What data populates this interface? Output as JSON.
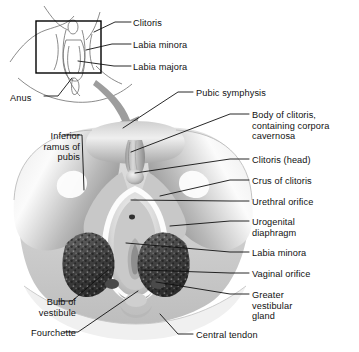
{
  "figure": {
    "background_color": "#ffffff",
    "ink_color": "#111111",
    "arrow_color": "#9a9a9a"
  },
  "inset": {
    "name": "orientation-inset",
    "box_color": "#000000",
    "labels": [
      {
        "id": "clitoris",
        "text": "Clitoris",
        "x": 133,
        "y": 18,
        "leader": "M131,22 L115,22 L94,32"
      },
      {
        "id": "labia-minora",
        "text": "Labia minora",
        "x": 133,
        "y": 40,
        "leader": "M131,44 L112,44 L86,50"
      },
      {
        "id": "labia-majora",
        "text": "Labia majora",
        "x": 133,
        "y": 62,
        "leader": "M131,66 L114,66 L78,61"
      },
      {
        "id": "anus",
        "text": "Anus",
        "x": 10,
        "y": 93,
        "leader": "M44,96 L58,96 L72,78"
      }
    ]
  },
  "main": {
    "name": "main-dissection-figure",
    "labels_right": [
      {
        "id": "pubic-symphysis",
        "text": "Pubic symphysis",
        "x": 196,
        "y": 88,
        "leader": "M193,92 L178,92 L123,128"
      },
      {
        "id": "body-of-clitoris",
        "text": "Body of clitoris,\ncontaining corpora\ncavernosa",
        "x": 252,
        "y": 110,
        "leader": "M249,114 L230,114 L131,152"
      },
      {
        "id": "clitoris-head",
        "text": "Clitoris (head)",
        "x": 252,
        "y": 155,
        "leader": "M249,159 L230,159 L135,173"
      },
      {
        "id": "crus-of-clitoris",
        "text": "Crus of clitoris",
        "x": 252,
        "y": 176,
        "leader": "M249,180 L230,180 L160,196"
      },
      {
        "id": "urethral-orifice",
        "text": "Urethral orifice",
        "x": 252,
        "y": 197,
        "leader": "M249,201 L230,201 L131,200"
      },
      {
        "id": "urogenital-diaphragm",
        "text": "Urogenital\ndiaphragm",
        "x": 252,
        "y": 217,
        "leader": "M249,221 L230,221 L170,226"
      },
      {
        "id": "labia-minora-main",
        "text": "Labia minora",
        "x": 252,
        "y": 248,
        "leader": "M249,252 L230,252 L126,243"
      },
      {
        "id": "vaginal-orifice",
        "text": "Vaginal orifice",
        "x": 252,
        "y": 269,
        "leader": "M249,273 L230,273 L141,270"
      },
      {
        "id": "greater-vestibular-gland",
        "text": "Greater\nvestibular\ngland",
        "x": 252,
        "y": 290,
        "leader": "M249,294 L230,294 L156,282"
      },
      {
        "id": "central-tendon",
        "text": "Central tendon",
        "x": 196,
        "y": 330,
        "leader": "M193,334 L178,334 L160,314"
      }
    ],
    "labels_left": [
      {
        "id": "inferior-ramus-of-pubis",
        "text": "Inferior\nramus of\npubis",
        "x": 18,
        "y": 131,
        "leader": "M64,135 L82,135 L84,190"
      },
      {
        "id": "bulb-of-vestibule",
        "text": "Bulb of\nvestibule",
        "x": 14,
        "y": 297,
        "leader": "M58,301 L72,301 L108,270"
      },
      {
        "id": "fourchette",
        "text": "Fourchette",
        "x": 14,
        "y": 328,
        "leader": "M64,332 L78,332 L138,291"
      }
    ]
  }
}
